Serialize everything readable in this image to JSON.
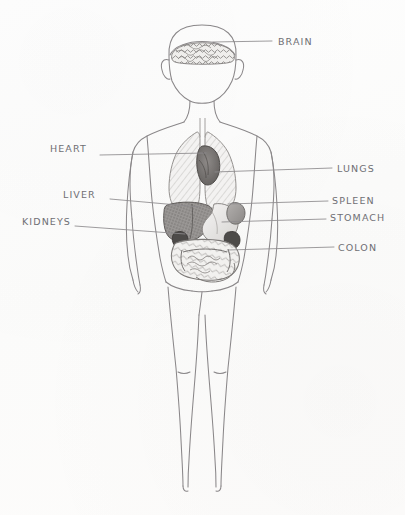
{
  "figure": {
    "medium": "pencil sketch on white paper",
    "background_color": "#fdfdfc",
    "ink_color": "#6f6f74"
  },
  "labels": [
    {
      "id": "brain",
      "text": "BRAIN",
      "side": "right",
      "text_x": 278,
      "text_y": 36,
      "line_x1": 213,
      "line_y1": 42,
      "line_x2": 272,
      "line_y2": 41
    },
    {
      "id": "heart",
      "text": "HEART",
      "side": "left",
      "text_x": 50,
      "text_y": 143,
      "line_x1": 100,
      "line_y1": 155,
      "line_x2": 206,
      "line_y2": 153
    },
    {
      "id": "lungs",
      "text": "LUNGS",
      "side": "right",
      "text_x": 337,
      "text_y": 163,
      "line_x1": 215,
      "line_y1": 172,
      "line_x2": 332,
      "line_y2": 168
    },
    {
      "id": "liver",
      "text": "LIVER",
      "side": "left",
      "text_x": 63,
      "text_y": 189,
      "line_x1": 110,
      "line_y1": 199,
      "line_x2": 200,
      "line_y2": 207
    },
    {
      "id": "spleen",
      "text": "SPLEEN",
      "side": "right",
      "text_x": 332,
      "text_y": 195,
      "line_x1": 228,
      "line_y1": 204,
      "line_x2": 328,
      "line_y2": 201
    },
    {
      "id": "kidneys",
      "text": "KIDNEYS",
      "side": "left",
      "text_x": 22,
      "text_y": 216,
      "line_x1": 75,
      "line_y1": 226,
      "line_x2": 185,
      "line_y2": 234
    },
    {
      "id": "stomach",
      "text": "STOMACH",
      "side": "right",
      "text_x": 330,
      "text_y": 212,
      "line_x1": 222,
      "line_y1": 222,
      "line_x2": 326,
      "line_y2": 219
    },
    {
      "id": "colon",
      "text": "COLON",
      "side": "right",
      "text_x": 338,
      "text_y": 242,
      "line_x1": 228,
      "line_y1": 250,
      "line_x2": 334,
      "line_y2": 247
    }
  ],
  "organs": [
    {
      "id": "brain",
      "name": "brain",
      "shading": "dense-squiggle",
      "tone": "#b9b6b4"
    },
    {
      "id": "lung-l",
      "name": "left lung",
      "shading": "light-hatch",
      "tone": "#cbc9c8"
    },
    {
      "id": "lung-r",
      "name": "right lung",
      "shading": "light-hatch",
      "tone": "#c7c5c4"
    },
    {
      "id": "heart",
      "name": "heart",
      "shading": "dark",
      "tone": "#7b7775"
    },
    {
      "id": "liver",
      "name": "liver",
      "shading": "dark-grain",
      "tone": "#8d8a88"
    },
    {
      "id": "stomach",
      "name": "stomach",
      "shading": "light",
      "tone": "#dedcda"
    },
    {
      "id": "spleen",
      "name": "spleen",
      "shading": "medium",
      "tone": "#a9a6a4"
    },
    {
      "id": "kidney-l",
      "name": "left kidney",
      "shading": "very-dark",
      "tone": "#4a4746"
    },
    {
      "id": "kidney-r",
      "name": "right kidney",
      "shading": "very-dark",
      "tone": "#4a4746"
    },
    {
      "id": "colon",
      "name": "colon/intestines",
      "shading": "outline-coil",
      "tone": "#9d9a98"
    }
  ],
  "body": {
    "name": "human figure outline",
    "view": "anterior",
    "pose": "standing, arms at sides"
  }
}
